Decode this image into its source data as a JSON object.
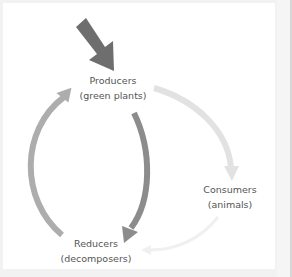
{
  "diagram": {
    "title": "",
    "nodes": [
      {
        "id": "producers",
        "line1": "Producers",
        "line2": "(green plants)"
      },
      {
        "id": "consumers",
        "line1": "Consumers",
        "line2": "(animals)"
      },
      {
        "id": "reducers",
        "line1": "Reducers",
        "line2": "(decomposers)"
      }
    ],
    "edges": [
      {
        "from": "energy-input",
        "to": "producers",
        "style": "large dark arrow",
        "color": "#6e6e6e"
      },
      {
        "from": "producers",
        "to": "consumers",
        "style": "light curved arrow",
        "color": "#e2e2e2"
      },
      {
        "from": "producers",
        "to": "reducers",
        "style": "dark curved arrow",
        "color": "#8c8c8c"
      },
      {
        "from": "consumers",
        "to": "reducers",
        "style": "faint curved arrow",
        "color": "#efefef"
      },
      {
        "from": "reducers",
        "to": "producers",
        "style": "medium curved arrow",
        "color": "#adadad"
      }
    ]
  },
  "colors": {
    "background": "#ffffff",
    "outer": "#f2f2f2",
    "text": "#555555"
  }
}
